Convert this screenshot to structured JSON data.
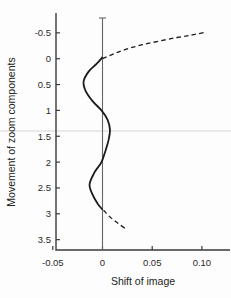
{
  "figure": {
    "background": "#fdfdfd",
    "axis_color": "#3a3a3a",
    "text_color": "#2a2a2a"
  },
  "scan_artifact_line": {
    "y_data": 1.4,
    "color": "#e9e9e9",
    "thickness": 2
  },
  "chart_data": {
    "type": "line",
    "title": "",
    "xlabel": "Shift of image",
    "ylabel": "Movement of zoom components",
    "xlim": [
      -0.05,
      0.126
    ],
    "ylim": [
      -0.88,
      3.8
    ],
    "y_axis_inverted": true,
    "grid": false,
    "legend": "none",
    "x_ticks": [
      {
        "v": -0.05,
        "label": "-0.05"
      },
      {
        "v": 0,
        "label": "0"
      },
      {
        "v": 0.05,
        "label": "0.05"
      },
      {
        "v": 0.1,
        "label": "0.10"
      }
    ],
    "y_ticks": [
      {
        "v": -0.5,
        "label": "-0.5"
      },
      {
        "v": 0,
        "label": "0"
      },
      {
        "v": 0.5,
        "label": "0.5"
      },
      {
        "v": 1,
        "label": "1"
      },
      {
        "v": 1.5,
        "label": "1.5"
      },
      {
        "v": 2,
        "label": "2"
      },
      {
        "v": 2.5,
        "label": "2.5"
      },
      {
        "v": 3,
        "label": "3"
      },
      {
        "v": 3.5,
        "label": "3.5"
      }
    ],
    "series": [
      {
        "name": "zero-shift-reference-line",
        "style": "solid",
        "smooth": false,
        "color": "#646464",
        "width": 1.1,
        "points": [
          [
            0,
            -0.787
          ],
          [
            0,
            3.7
          ]
        ]
      },
      {
        "name": "reference-line-top-cap",
        "style": "solid",
        "smooth": false,
        "color": "#646464",
        "width": 1.1,
        "points": [
          [
            -0.0035,
            -0.787
          ],
          [
            0.0035,
            -0.787
          ]
        ]
      },
      {
        "name": "zoom-shift-solid-curve",
        "style": "solid",
        "smooth": true,
        "color": "#1c1c1c",
        "width": 1.8,
        "points": [
          [
            0.0,
            -0.03
          ],
          [
            -0.006,
            0.1
          ],
          [
            -0.014,
            0.25
          ],
          [
            -0.019,
            0.44
          ],
          [
            -0.017,
            0.62
          ],
          [
            -0.01,
            0.82
          ],
          [
            -0.001,
            1.0
          ],
          [
            0.005,
            1.18
          ],
          [
            0.0075,
            1.38
          ],
          [
            0.006,
            1.58
          ],
          [
            0.003,
            1.78
          ],
          [
            -0.001,
            2.0
          ],
          [
            -0.008,
            2.2
          ],
          [
            -0.013,
            2.43
          ],
          [
            -0.01,
            2.63
          ],
          [
            -0.005,
            2.8
          ],
          [
            0.0,
            2.92
          ]
        ]
      },
      {
        "name": "upper-dashed-branch",
        "style": "dashed",
        "smooth": true,
        "color": "#1c1c1c",
        "width": 1.3,
        "points": [
          [
            0.0,
            0.0
          ],
          [
            0.012,
            -0.1
          ],
          [
            0.025,
            -0.19
          ],
          [
            0.04,
            -0.27
          ],
          [
            0.057,
            -0.34
          ],
          [
            0.075,
            -0.41
          ],
          [
            0.09,
            -0.46
          ],
          [
            0.103,
            -0.51
          ]
        ]
      },
      {
        "name": "lower-dashed-branch",
        "style": "dashed",
        "smooth": true,
        "color": "#1c1c1c",
        "width": 1.3,
        "points": [
          [
            0.001,
            2.93
          ],
          [
            0.008,
            3.07
          ],
          [
            0.016,
            3.19
          ],
          [
            0.024,
            3.3
          ]
        ]
      }
    ]
  }
}
